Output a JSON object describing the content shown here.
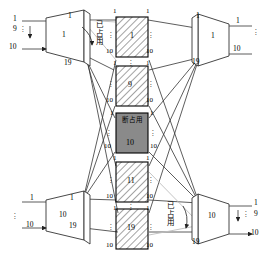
{
  "diagram": {
    "colors": {
      "line": "#333333",
      "hatch": "#555555",
      "occupied_fill": "#8a8a8a",
      "box_stroke": "#000000",
      "faint_line": "#b0b0b0"
    },
    "dots": "⋮"
  },
  "input_modules": [
    {
      "id": "in-top",
      "inner_label": "1",
      "in_labels": [
        "1",
        "9",
        "10"
      ],
      "out_labels": [
        "1",
        "19"
      ]
    },
    {
      "id": "in-bottom",
      "inner_label": "10",
      "in_labels": [
        "1",
        "10"
      ],
      "out_labels": [
        "1",
        "19"
      ]
    }
  ],
  "middle_modules": [
    {
      "id": "mid-1",
      "inner_label": "1",
      "fill": "hatched",
      "top_left": "1",
      "top_right": "1",
      "bottom_left": "10",
      "bottom_right": "10"
    },
    {
      "id": "mid-2",
      "inner_label": "9",
      "fill": "hatched",
      "top_left": "1",
      "top_right": "1",
      "bottom_left": "10",
      "bottom_right": "10"
    },
    {
      "id": "mid-3",
      "inner_label": "10",
      "status_text": "断占用",
      "fill": "solid-gray",
      "top_left": "1",
      "top_right": "1",
      "bottom_left": "10",
      "bottom_right": "10"
    },
    {
      "id": "mid-4",
      "inner_label": "11",
      "fill": "hatched",
      "top_left": "1",
      "top_right": "1",
      "bottom_left": "10",
      "bottom_right": "10"
    },
    {
      "id": "mid-5",
      "inner_label": "19",
      "fill": "hatched",
      "top_left": "1",
      "top_right": "1",
      "bottom_left": "10",
      "bottom_right": "10"
    }
  ],
  "output_modules": [
    {
      "id": "out-top",
      "inner_label": "1",
      "in_labels": [
        "1",
        "19"
      ],
      "out_labels": [
        "1",
        "10"
      ]
    },
    {
      "id": "out-bottom",
      "inner_label": "10",
      "in_labels": [
        "19"
      ],
      "out_labels": [
        "1",
        "9",
        "10"
      ]
    }
  ],
  "annotations": [
    {
      "id": "occupied-top",
      "text": "已占用"
    },
    {
      "id": "occupied-bottom",
      "text": "已占用"
    }
  ]
}
